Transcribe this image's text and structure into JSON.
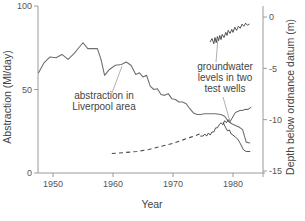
{
  "chart_data": {
    "type": "line",
    "title": "",
    "xlabel": "Year",
    "ylabel": "Abstraction (Ml/day)",
    "y2label": "Depth below ordnance datum (m)",
    "xlim": [
      1947.5,
      1985.0
    ],
    "ylim": [
      0,
      100
    ],
    "y2lim": [
      -16.2,
      0.5
    ],
    "xticks": [
      1950,
      1960,
      1970,
      1980
    ],
    "xticklabels": [
      "1950",
      "1960",
      "1970",
      "1980"
    ],
    "yticks": [
      0,
      50,
      100
    ],
    "yticklabels": [
      "0",
      "50",
      "100"
    ],
    "y2ticks": [
      0,
      -5,
      -10,
      -15
    ],
    "y2ticklabels": [
      "0",
      "-5",
      "-10",
      "-15"
    ],
    "grid": false,
    "legend": "none",
    "annotations": [
      {
        "name": "abstraction-annotation",
        "text": "abstraction in\nLiverpool area",
        "line1": "abstraction in",
        "line2": "Liverpool area",
        "points_to_year": 1961.5,
        "points_to_value": 64
      },
      {
        "name": "groundwater-annotation",
        "text": "groundwater\nlevels in two\ntest wells",
        "line1": "groundwater",
        "line2": "levels in two",
        "line3": "test wells",
        "points_to_year_upper": 1977.5,
        "points_to_value_upper": -2.0,
        "points_to_year_lower": 1979.5,
        "points_to_value_lower": -10.2
      }
    ],
    "series": [
      {
        "name": "abstraction in Liverpool area",
        "axis": "left",
        "units": "Ml/day",
        "color": "#6f6f6f",
        "style": "solid",
        "x": [
          1947.6,
          1948.5,
          1949.5,
          1950.5,
          1951.5,
          1952.5,
          1953.5,
          1954.3,
          1955.0,
          1955.8,
          1956.6,
          1957.4,
          1958.0,
          1958.6,
          1959.4,
          1960.4,
          1961.4,
          1962.2,
          1963.0,
          1963.8,
          1964.4,
          1965.0,
          1965.6,
          1966.2,
          1966.8,
          1967.4,
          1968.0,
          1968.6,
          1969.2,
          1969.8,
          1970.4,
          1971.0,
          1971.6,
          1972.2,
          1972.8,
          1973.4,
          1974.0,
          1974.6,
          1975.2,
          1976.0,
          1977.0,
          1978.0,
          1978.6,
          1979.2,
          1979.8,
          1980.4,
          1981.0,
          1981.6,
          1982.2,
          1982.8
        ],
        "y": [
          60.0,
          66.0,
          69.5,
          69.0,
          71.0,
          68.0,
          71.5,
          75.0,
          78.0,
          74.5,
          74.5,
          74.5,
          68.0,
          58.5,
          62.0,
          64.5,
          65.0,
          66.5,
          64.5,
          59.0,
          60.0,
          57.5,
          58.5,
          52.0,
          50.0,
          50.5,
          47.0,
          46.5,
          47.5,
          44.5,
          44.0,
          42.5,
          42.5,
          41.5,
          38.5,
          36.0,
          35.0,
          35.0,
          35.5,
          35.5,
          35.5,
          35.0,
          34.0,
          31.0,
          29.5,
          28.5,
          27.5,
          26.0,
          18.5,
          18.0
        ]
      },
      {
        "name": "test well 1 (upper, shallow)",
        "axis": "right",
        "units": "m below ordnance datum",
        "color": "#2b2b2b",
        "style": "solid",
        "x": [
          1976.2,
          1976.5,
          1976.8,
          1977.0,
          1977.2,
          1977.4,
          1977.6,
          1977.8,
          1978.0,
          1978.2,
          1978.5,
          1978.8,
          1979.0,
          1979.2,
          1979.5,
          1979.8,
          1980.0,
          1980.3,
          1980.6,
          1980.9,
          1981.2,
          1981.5,
          1981.8,
          1982.1,
          1982.4,
          1982.7
        ],
        "y": [
          -2.4,
          -2.1,
          -2.6,
          -2.0,
          -2.5,
          -1.9,
          -2.3,
          -1.8,
          -2.2,
          -1.7,
          -2.0,
          -1.5,
          -1.8,
          -1.3,
          -1.6,
          -1.2,
          -1.5,
          -1.0,
          -1.3,
          -0.9,
          -1.1,
          -0.7,
          -0.9,
          -0.6,
          -0.8,
          -0.7
        ]
      },
      {
        "name": "test well 2 (lower, deep)",
        "axis": "right",
        "units": "m below ordnance datum",
        "color": "#2b2b2b",
        "style": "solid",
        "x": [
          1974.6,
          1975.0,
          1975.3,
          1975.6,
          1975.9,
          1976.2,
          1976.5,
          1976.8,
          1977.1,
          1977.4,
          1977.7,
          1978.0,
          1978.3,
          1978.6,
          1978.9,
          1979.2,
          1979.5,
          1979.8,
          1980.1,
          1980.4,
          1980.8,
          1981.2,
          1981.6,
          1982.0,
          1982.5,
          1983.0
        ],
        "y": [
          -11.6,
          -11.6,
          -11.4,
          -11.6,
          -11.3,
          -11.5,
          -11.2,
          -11.2,
          -10.8,
          -10.8,
          -10.5,
          -10.3,
          -10.5,
          -10.1,
          -10.3,
          -10.0,
          -10.2,
          -9.9,
          -9.6,
          -9.3,
          -9.2,
          -9.1,
          -9.1,
          -9.0,
          -9.0,
          -8.8
        ]
      },
      {
        "name": "modelled groundwater recovery (dashed)",
        "axis": "right",
        "units": "m below ordnance datum",
        "color": "#4a4a4a",
        "style": "dashed",
        "x": [
          1959.8,
          1962.0,
          1964.0,
          1966.0,
          1968.0,
          1970.0,
          1971.5,
          1973.0,
          1974.0,
          1974.8
        ],
        "y": [
          -13.3,
          -13.2,
          -13.1,
          -12.9,
          -12.6,
          -12.3,
          -12.0,
          -11.7,
          -11.5,
          -11.3
        ]
      },
      {
        "name": "test well 2 lower branch continuation",
        "axis": "right",
        "units": "m below ordnance datum",
        "color": "#2b2b2b",
        "style": "solid",
        "x": [
          1978.4,
          1978.8,
          1979.1,
          1979.4,
          1979.7,
          1980.0,
          1980.4,
          1980.8,
          1981.2,
          1981.7,
          1982.2,
          1982.8
        ],
        "y": [
          -10.3,
          -10.8,
          -11.1,
          -11.0,
          -11.4,
          -11.5,
          -11.7,
          -11.9,
          -12.3,
          -12.9,
          -13.1,
          -13.1
        ]
      }
    ]
  }
}
